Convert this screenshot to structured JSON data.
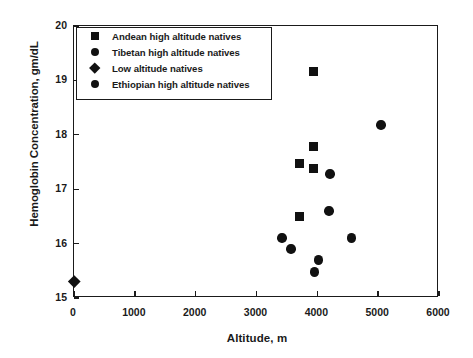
{
  "chart_data": {
    "type": "scatter",
    "title": "",
    "xlabel": "Altitude, m",
    "ylabel": "Hemoglobin Concentration, gm/dL",
    "xlim": [
      0,
      6000
    ],
    "ylim": [
      15,
      20
    ],
    "xticks": [
      "0",
      "1000",
      "2000",
      "3000",
      "4000",
      "5000",
      "6000"
    ],
    "yticks": [
      "15",
      "16",
      "17",
      "18",
      "19",
      "20"
    ],
    "grid": false,
    "legend_position": "upper left",
    "marker_color": "#111111",
    "series": [
      {
        "name": "Andean high altitude natives",
        "marker": "square",
        "points": [
          {
            "x": 3930,
            "y": 19.17
          },
          {
            "x": 3930,
            "y": 17.78
          },
          {
            "x": 3710,
            "y": 17.48
          },
          {
            "x": 3930,
            "y": 17.38
          },
          {
            "x": 3710,
            "y": 16.5
          }
        ]
      },
      {
        "name": "Tibetan high altitude natives",
        "marker": "circle",
        "points": [
          {
            "x": 5050,
            "y": 18.18
          },
          {
            "x": 4210,
            "y": 17.28
          },
          {
            "x": 4190,
            "y": 16.6
          },
          {
            "x": 4560,
            "y": 16.1
          }
        ]
      },
      {
        "name": "Low altitude natives",
        "marker": "diamond",
        "points": [
          {
            "x": 0,
            "y": 15.3
          }
        ]
      },
      {
        "name": "Ethiopian high altitude natives",
        "marker": "circle",
        "points": [
          {
            "x": 3420,
            "y": 16.1
          },
          {
            "x": 3570,
            "y": 15.9
          },
          {
            "x": 4020,
            "y": 15.7
          },
          {
            "x": 3950,
            "y": 15.48
          }
        ]
      }
    ]
  },
  "legend": {
    "entries": [
      {
        "label": "Andean high altitude natives",
        "marker": "square"
      },
      {
        "label": "Tibetan high altitude natives",
        "marker": "circle"
      },
      {
        "label": "Low altitude natives",
        "marker": "diamond"
      },
      {
        "label": "Ethiopian high altitude natives",
        "marker": "circle"
      }
    ]
  }
}
